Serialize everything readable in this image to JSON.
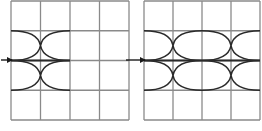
{
  "figure": {
    "panels": [
      {
        "id": "left",
        "grid": {
          "x0": 11,
          "y0": 1,
          "cols": 4,
          "rows": 4,
          "cell_w": 29.5,
          "cell_h": 29.75
        },
        "arrow": {
          "x1": 1,
          "x2": 12,
          "y": 60
        },
        "lens_count": 1
      },
      {
        "id": "right",
        "grid": {
          "x0": 144,
          "y0": 1,
          "cols": 4,
          "rows": 4,
          "cell_w": 29,
          "cell_h": 29.75
        },
        "arrow": {
          "x1": 126,
          "x2": 145,
          "y": 60
        },
        "lens_count": 2
      }
    ],
    "colors": {
      "grid_line": "#8a8a8a",
      "curve": "#2a2a2a",
      "arrow": "#1a1a1a",
      "background": "#ffffff"
    }
  }
}
